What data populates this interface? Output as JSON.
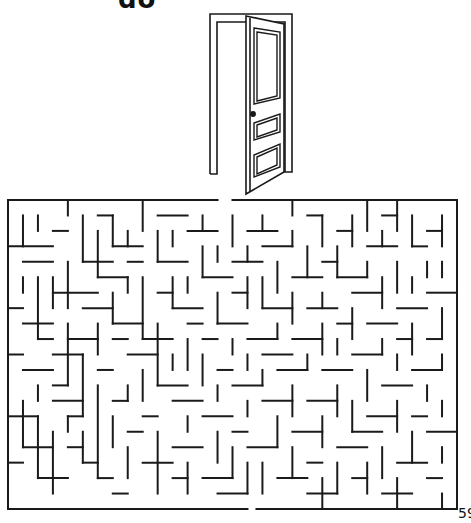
{
  "page": {
    "title_partial": "do",
    "page_number": "59"
  },
  "illustration": {
    "subject": "open-door",
    "line_color": "#1a1a1a"
  },
  "maze": {
    "columns": 30,
    "rows": 20,
    "wall_color": "#1a1a1a",
    "entrance": "top",
    "exit": "bottom"
  }
}
